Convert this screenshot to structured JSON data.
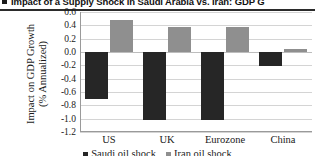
{
  "title": {
    "bullet_icon": "bullet-square-icon",
    "text": "Impact of a Supply Shock in Saudi Arabia vs. Iran: GDP G"
  },
  "chart_data": {
    "type": "bar",
    "title": "Impact of a Supply Shock in Saudi Arabia vs. Iran: GDP G",
    "categories": [
      "US",
      "UK",
      "Eurozone",
      "China"
    ],
    "series": [
      {
        "name": "Saudi oil shock",
        "color": "#262626",
        "values": [
          -0.7,
          -1.02,
          -1.02,
          -0.21
        ]
      },
      {
        "name": "Iran oil shock",
        "color": "#8f8f8f",
        "values": [
          0.48,
          0.38,
          0.37,
          0.05
        ]
      }
    ],
    "xlabel": "",
    "ylabel": "Impact on GDP Growth\n(% Annualized)",
    "ylabel_line1": "Impact on GDP Growth",
    "ylabel_line2": "(% Annualized)",
    "ylim": [
      -1.2,
      0.6
    ],
    "ytick_values": [
      0.6,
      0.4,
      0.2,
      0.0,
      -0.2,
      -0.4,
      -0.6,
      -0.8,
      -1.0,
      -1.2
    ],
    "ytick_labels": [
      "0.6",
      "0.4",
      "0.2",
      "0.0",
      "-0.2",
      "-0.4",
      "-0.6",
      "-0.8",
      "-1.0",
      "-1.2"
    ],
    "grid": true,
    "legend_position": "bottom"
  }
}
